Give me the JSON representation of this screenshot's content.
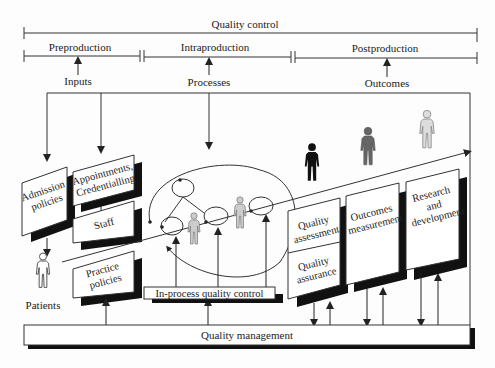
{
  "diagram": {
    "title": "Quality control",
    "phases": [
      {
        "label": "Preproduction",
        "driver": "Inputs"
      },
      {
        "label": "Intraproduction",
        "driver": "Processes"
      },
      {
        "label": "Postproduction",
        "driver": "Outcomes"
      }
    ],
    "boxes": {
      "admission": "Admission policies",
      "appointments": "Appointments, Credentialling",
      "staff": "Staff",
      "practice": "Practice policies",
      "in_process": "In-process quality control",
      "quality_assessment": "Quality assessment",
      "quality_assurance": "Quality assurance",
      "outcomes_measurement": "Outcomes measurement",
      "research": "Research and development",
      "quality_management": "Quality management"
    },
    "patients_label": "Patients",
    "icons": [
      "patient-figure-icon",
      "staff-figure-icon",
      "outcome-figure-icon"
    ],
    "colors": {
      "line": "#333333",
      "shadow": "#111111",
      "figure_dark": "#111111",
      "figure_mid": "#666666",
      "figure_light": "#aaaaaa"
    }
  }
}
